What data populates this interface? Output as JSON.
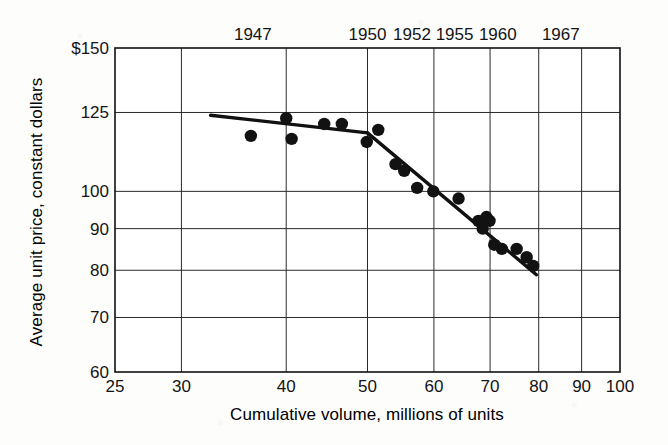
{
  "chart_data": {
    "type": "scatter",
    "title": "",
    "subtitle": "",
    "xlabel": "Cumulative volume, millions of units",
    "ylabel": "Average unit price, constant dollars",
    "xscale": "log",
    "yscale": "log",
    "xlim": [
      25,
      100
    ],
    "ylim": [
      60,
      150
    ],
    "grid": true,
    "legend": "none",
    "x_ticks": [
      {
        "value": 25,
        "label": "25"
      },
      {
        "value": 30,
        "label": "30"
      },
      {
        "value": 40,
        "label": "40"
      },
      {
        "value": 50,
        "label": "50"
      },
      {
        "value": 60,
        "label": "60"
      },
      {
        "value": 70,
        "label": "70"
      },
      {
        "value": 80,
        "label": "80"
      },
      {
        "value": 90,
        "label": "90"
      },
      {
        "value": 100,
        "label": "100"
      }
    ],
    "y_ticks": [
      {
        "value": 150,
        "label": "$150"
      },
      {
        "value": 125,
        "label": "125"
      },
      {
        "value": 100,
        "label": "100"
      },
      {
        "value": 90,
        "label": "90"
      },
      {
        "value": 80,
        "label": "80"
      },
      {
        "value": 70,
        "label": "70"
      },
      {
        "value": 60,
        "label": "60"
      }
    ],
    "top_axis_labels": [
      {
        "label": "1947",
        "x": 36.5
      },
      {
        "label": "1950",
        "x": 50.0
      },
      {
        "label": "1952",
        "x": 56.5
      },
      {
        "label": "1955",
        "x": 63.5
      },
      {
        "label": "1960",
        "x": 71.5
      },
      {
        "label": "1967",
        "x": 85.0
      }
    ],
    "points": [
      {
        "x": 36.3,
        "y": 117
      },
      {
        "x": 40.0,
        "y": 123
      },
      {
        "x": 40.6,
        "y": 116
      },
      {
        "x": 44.4,
        "y": 121
      },
      {
        "x": 46.6,
        "y": 121
      },
      {
        "x": 49.9,
        "y": 115
      },
      {
        "x": 51.5,
        "y": 119
      },
      {
        "x": 54.0,
        "y": 108
      },
      {
        "x": 55.3,
        "y": 106
      },
      {
        "x": 57.3,
        "y": 101
      },
      {
        "x": 59.9,
        "y": 100
      },
      {
        "x": 64.2,
        "y": 98
      },
      {
        "x": 67.8,
        "y": 92
      },
      {
        "x": 68.6,
        "y": 90
      },
      {
        "x": 69.3,
        "y": 93
      },
      {
        "x": 69.9,
        "y": 92
      },
      {
        "x": 70.8,
        "y": 86
      },
      {
        "x": 72.3,
        "y": 85
      },
      {
        "x": 75.3,
        "y": 85
      },
      {
        "x": 77.4,
        "y": 83
      },
      {
        "x": 78.8,
        "y": 81
      }
    ],
    "trend_line": {
      "style": "solid",
      "color": "#111111",
      "segments": [
        {
          "x1": 32.5,
          "y1": 124,
          "x2": 50.0,
          "y2": 118
        },
        {
          "x1": 50.0,
          "y1": 118,
          "x2": 79.5,
          "y2": 79
        }
      ]
    }
  }
}
